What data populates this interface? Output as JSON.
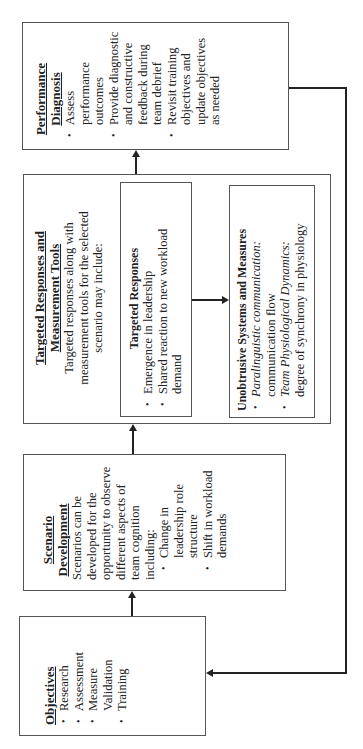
{
  "diagram": {
    "orientation": "rotated-90-ccw",
    "objectives": {
      "title": "Objectives",
      "items": [
        "Research",
        "Assessment",
        "Measure Validation",
        "Training"
      ]
    },
    "scenario": {
      "title": "Scenario Development",
      "text": "Scenarios can be developed for the opportunity to observe different aspects of team cognition including:",
      "items": [
        "Change in leadership role structure",
        "Shift in workload demands"
      ]
    },
    "targeted": {
      "title": "Targeted Responses and Measurement Tools",
      "text": "Targeted responses along with measurement tools for the selected scenario may include:",
      "responses": {
        "title": "Targeted Responses",
        "items": [
          "Emergence in leadership",
          "Shared reaction to new workload demand"
        ]
      },
      "unobtrusive": {
        "title": "Unobtrusive Systems and Measures",
        "items": [
          {
            "label": "Paralinguistic communication",
            "suffix": ":",
            "desc": "communication flow"
          },
          {
            "label": "Team Physiological Dynamics",
            "suffix": ":",
            "desc": "degree of synchrony in physiology"
          }
        ]
      }
    },
    "performance": {
      "title": "Performance Diagnosis",
      "items": [
        "Assess performance outcomes",
        "Provide diagnostic and constructive feedback during team debrief",
        "Revisit training objectives and update objectives as needed"
      ]
    },
    "bullet": "•",
    "flow": [
      "Objectives",
      "Scenario Development",
      "Targeted Responses and Measurement Tools",
      "Performance Diagnosis",
      "Objectives"
    ]
  }
}
